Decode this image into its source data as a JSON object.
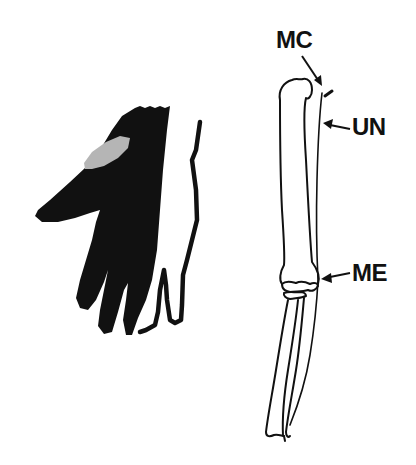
{
  "figure": {
    "panels": [
      {
        "id": "hand",
        "description": "Dorsal hand silhouette with shaded region"
      },
      {
        "id": "arm",
        "description": "Arm bones line drawing (humerus, ulna, radius)"
      }
    ],
    "labels": {
      "mc": "MC",
      "un": "UN",
      "me": "ME"
    },
    "colors": {
      "ink": "#111111",
      "highlight": "#b5b5b5",
      "background": "#ffffff"
    }
  }
}
